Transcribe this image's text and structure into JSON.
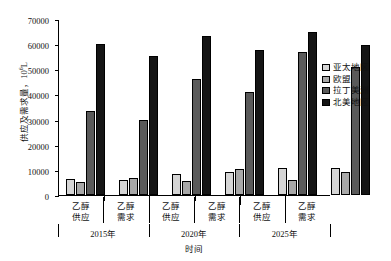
{
  "chart_data": {
    "type": "bar",
    "title": "",
    "xlabel": "时间",
    "ylabel": "供应及需求量，10⁶L",
    "ylabel_text": "供应及需求量，10",
    "ylabel_exp": "6",
    "ylabel_unit": "L",
    "ylim": [
      0,
      70000
    ],
    "yticks": [
      0,
      10000,
      20000,
      30000,
      40000,
      50000,
      60000,
      70000
    ],
    "ytick_labels": [
      "0",
      "10000",
      "20000",
      "30000",
      "40000",
      "50000",
      "60000",
      "70000"
    ],
    "grid": false,
    "legend_position": "right",
    "categories": [
      "乙醇供应",
      "乙醇需求",
      "乙醇供应",
      "乙醇需求",
      "乙醇供应",
      "乙醇需求"
    ],
    "category_lines": [
      {
        "l1": "乙醇",
        "l2": "供应"
      },
      {
        "l1": "乙醇",
        "l2": "需求"
      },
      {
        "l1": "乙醇",
        "l2": "供应"
      },
      {
        "l1": "乙醇",
        "l2": "需求"
      },
      {
        "l1": "乙醇",
        "l2": "供应"
      },
      {
        "l1": "乙醇",
        "l2": "需求"
      }
    ],
    "groups": [
      "2015年",
      "2020年",
      "2025年"
    ],
    "series": [
      {
        "name": "亚太地区",
        "color": "#d5d5d5",
        "values": [
          6200,
          5800,
          8300,
          9000,
          10800,
          10600
        ]
      },
      {
        "name": "欧盟",
        "color": "#a8a8a8",
        "values": [
          5200,
          6700,
          5700,
          10200,
          6000,
          9000
        ]
      },
      {
        "name": "拉丁美洲",
        "color": "#5a5a5a",
        "values": [
          33500,
          30000,
          46000,
          41000,
          56800,
          51000
        ]
      },
      {
        "name": "北美地区",
        "color": "#151515",
        "values": [
          60000,
          55300,
          63300,
          57500,
          64700,
          59800
        ]
      }
    ]
  }
}
